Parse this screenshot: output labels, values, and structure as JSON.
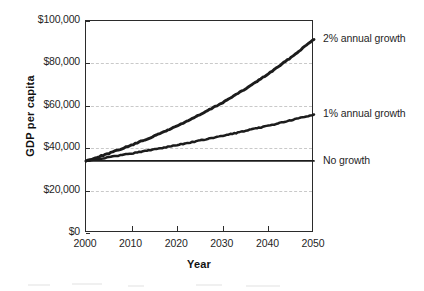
{
  "chart_data": {
    "type": "line",
    "title": "",
    "xlabel": "Year",
    "ylabel": "GDP per capita",
    "x": [
      2000,
      2005,
      2010,
      2015,
      2020,
      2025,
      2030,
      2035,
      2040,
      2045,
      2050
    ],
    "xlim": [
      2000,
      2050
    ],
    "ylim": [
      0,
      100000
    ],
    "grid": true,
    "legend_position": "right-of-plot-at-series-end",
    "series": [
      {
        "name": "2% annual growth",
        "values": [
          34000,
          37540,
          41450,
          45760,
          50520,
          55780,
          61580,
          67990,
          75070,
          82880,
          91500
        ]
      },
      {
        "name": "1% annual growth",
        "values": [
          34000,
          35730,
          37560,
          39470,
          41490,
          43600,
          45830,
          48170,
          50620,
          53200,
          55910
        ]
      },
      {
        "name": "No growth",
        "values": [
          34000,
          34000,
          34000,
          34000,
          34000,
          34000,
          34000,
          34000,
          34000,
          34000,
          34000
        ]
      }
    ],
    "y_ticks": [
      {
        "value": 0,
        "label": "$0"
      },
      {
        "value": 20000,
        "label": "$20,000"
      },
      {
        "value": 40000,
        "label": "$40,000"
      },
      {
        "value": 60000,
        "label": "$60,000"
      },
      {
        "value": 80000,
        "label": "$80,000"
      },
      {
        "value": 100000,
        "label": "$100,000"
      }
    ],
    "x_ticks": [
      {
        "value": 2000,
        "label": "2000"
      },
      {
        "value": 2010,
        "label": "2010"
      },
      {
        "value": 2020,
        "label": "2020"
      },
      {
        "value": 2030,
        "label": "2030"
      },
      {
        "value": 2040,
        "label": "2040"
      },
      {
        "value": 2050,
        "label": "2050"
      }
    ],
    "colors": {
      "series_line": "#1c1c1c",
      "axis": "#2b2b2b",
      "gridline": "#c9c9c9",
      "text": "#1f1f1f",
      "background": "#ffffff"
    }
  }
}
